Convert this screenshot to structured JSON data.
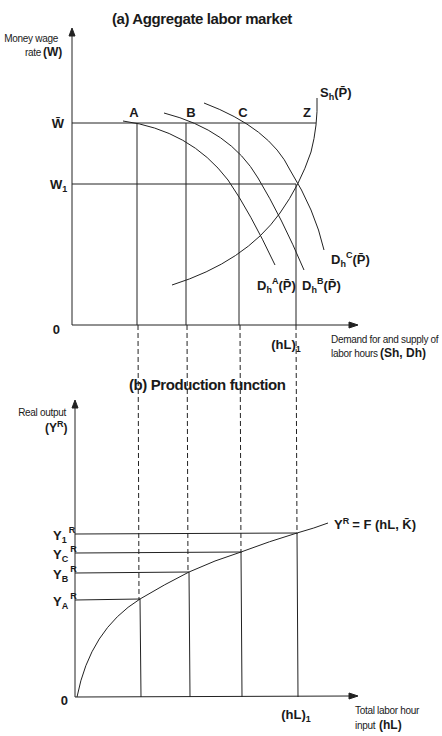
{
  "panel_a": {
    "title": "(a) Aggregate labor market",
    "y_axis_label_line1": "Money wage",
    "y_axis_label_line2": "rate",
    "y_axis_symbol": "(W)",
    "x_axis_label_line1": "Demand for and supply of",
    "x_axis_label_line2": "labor hours",
    "x_axis_symbol": "(Sh, Dh)",
    "origin": "0",
    "y_ticks": {
      "w_bar": "W̄",
      "w1": "W",
      "w1_sub": "1"
    },
    "x_tick": {
      "label": "(hL)",
      "sub": "1"
    },
    "points": {
      "A": "A",
      "B": "B",
      "C": "C",
      "Z": "Z"
    },
    "curves": {
      "supply": {
        "main": "S",
        "sub": "h",
        "arg": "(P̄)"
      },
      "demand_a": {
        "main": "D",
        "sub": "h",
        "sup": "A",
        "arg": "(P̄)"
      },
      "demand_b": {
        "main": "D",
        "sub": "h",
        "sup": "B",
        "arg": "(P̄)"
      },
      "demand_c": {
        "main": "D",
        "sub": "h",
        "sup": "C",
        "arg": "(P̄)"
      }
    }
  },
  "panel_b": {
    "title": "(b) Production function",
    "y_axis_label_line1": "Real output",
    "y_axis_symbol": "(Y",
    "y_axis_symbol_sup": "R",
    "y_axis_symbol_close": ")",
    "x_axis_label_line1": "Total labor hour",
    "x_axis_label_line2": "input",
    "x_axis_symbol": "(hL)",
    "origin": "0",
    "x_tick": {
      "label": "(hL)",
      "sub": "1"
    },
    "y_ticks": [
      {
        "main": "Y",
        "sub": "1",
        "sup": "R"
      },
      {
        "main": "Y",
        "sub": "C",
        "sup": "R"
      },
      {
        "main": "Y",
        "sub": "B",
        "sup": "R"
      },
      {
        "main": "Y",
        "sub": "A",
        "sup": "R"
      }
    ],
    "function_label": {
      "lhs": "Y",
      "lhs_sup": "R",
      "rhs": "= F (hL, K̄)"
    }
  }
}
